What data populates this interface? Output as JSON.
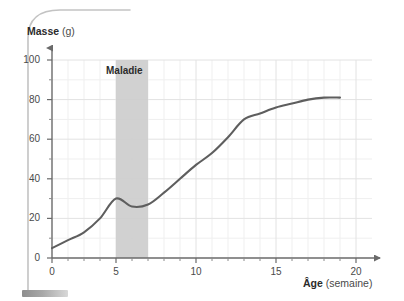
{
  "chart_data": {
    "type": "line",
    "title": "",
    "xlabel_bold": "Âge",
    "xlabel_unit": " (semaine)",
    "ylabel_bold": "Masse",
    "ylabel_unit": " (g)",
    "xlabel": "Âge (semaine)",
    "ylabel": "Masse (g)",
    "xlim": [
      0,
      20
    ],
    "ylim": [
      0,
      100
    ],
    "xticks": [
      "0",
      "5",
      "10",
      "15",
      "20"
    ],
    "yticks": [
      "0",
      "20",
      "40",
      "60",
      "80",
      "100"
    ],
    "xtick_values": [
      0,
      5,
      10,
      15,
      20
    ],
    "ytick_values": [
      0,
      20,
      40,
      60,
      80,
      100
    ],
    "x_minor_step": 1,
    "y_minor_step": 10,
    "grid": true,
    "legend": "none",
    "series": [
      {
        "name": "Masse",
        "color": "#5e5e5e",
        "x": [
          0,
          1,
          2,
          3,
          4,
          5,
          6,
          7,
          8,
          9,
          10,
          11,
          12,
          13,
          14,
          15,
          16,
          17,
          18
        ],
        "values": [
          5,
          9,
          13,
          20,
          30,
          26,
          27,
          33,
          40,
          47,
          53,
          61,
          70,
          73,
          76,
          78,
          80,
          81,
          81
        ]
      }
    ],
    "annotations": [
      {
        "name": "maladie-band",
        "label": "Maladie",
        "type": "vertical-band",
        "x_start": 4,
        "x_end": 6,
        "color": "#cfcfcf"
      }
    ],
    "colors": {
      "curve": "#5e5e5e",
      "grid": "#e8e8e8",
      "axis": "#6a6a6a",
      "band": "#cfcfcf",
      "text": "#3b3b3b",
      "background": "#ffffff",
      "deco_border": "#c9c9c9"
    }
  }
}
